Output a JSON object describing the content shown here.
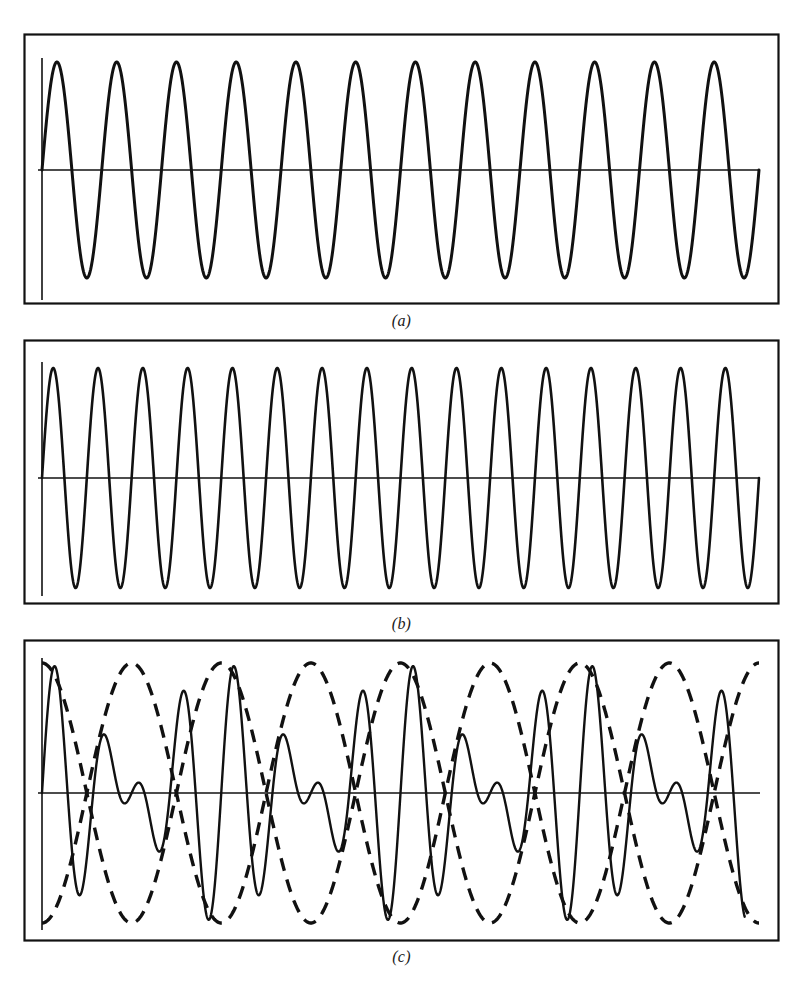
{
  "figure": {
    "background_color": "#ffffff",
    "stroke_color": "#111111"
  },
  "panels": [
    {
      "id": "a",
      "caption": "(a)",
      "description": "Lower-frequency sinusoid",
      "line_style": "solid"
    },
    {
      "id": "b",
      "caption": "(b)",
      "description": "Higher-frequency sinusoid",
      "line_style": "solid"
    },
    {
      "id": "c",
      "caption": "(c)",
      "description": "Sum of the two sinusoids with dashed beat envelope",
      "line_style": "solid",
      "envelope_style": "dashed"
    }
  ],
  "chart_data": [
    {
      "type": "line",
      "title": "(a)",
      "xlabel": "",
      "ylabel": "",
      "xlim": [
        0,
        1
      ],
      "ylim": [
        -1,
        1
      ],
      "grid": false,
      "legend": "none",
      "series": [
        {
          "name": "wave-1",
          "waveform": "sine",
          "amplitude": 1.0,
          "cycles": 12,
          "phase_deg": 0,
          "offset": 0,
          "style": "solid"
        }
      ],
      "axes": {
        "horizontal_axis_at_y": 0,
        "vertical_axis_at_x": 0,
        "frame": true
      }
    },
    {
      "type": "line",
      "title": "(b)",
      "xlabel": "",
      "ylabel": "",
      "xlim": [
        0,
        1
      ],
      "ylim": [
        -1,
        1
      ],
      "grid": false,
      "legend": "none",
      "series": [
        {
          "name": "wave-2",
          "waveform": "sine",
          "amplitude": 1.0,
          "cycles": 16,
          "phase_deg": 0,
          "offset": 0,
          "style": "solid"
        }
      ],
      "axes": {
        "horizontal_axis_at_y": 0,
        "vertical_axis_at_x": 0,
        "frame": true
      }
    },
    {
      "type": "line",
      "title": "(c)",
      "xlabel": "",
      "ylabel": "",
      "xlim": [
        0,
        1
      ],
      "ylim": [
        -2,
        2
      ],
      "grid": false,
      "legend": "none",
      "series": [
        {
          "name": "resultant-sum",
          "waveform": "sum-of-sines",
          "component_cycles": [
            12,
            16
          ],
          "amplitude": 2.0,
          "carrier_cycles": 14,
          "style": "solid"
        },
        {
          "name": "upper-envelope",
          "waveform": "cosine-envelope",
          "amplitude": 2.0,
          "beat_cycles": 4,
          "sign": 1,
          "style": "dashed"
        },
        {
          "name": "lower-envelope",
          "waveform": "cosine-envelope",
          "amplitude": 2.0,
          "beat_cycles": 4,
          "sign": -1,
          "style": "dashed"
        }
      ],
      "axes": {
        "horizontal_axis_at_y": 0,
        "vertical_axis_at_x": 0,
        "frame": true
      }
    }
  ]
}
